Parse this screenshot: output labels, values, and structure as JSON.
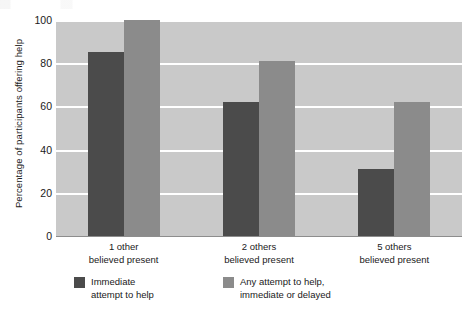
{
  "chart_data": {
    "type": "bar",
    "title": "",
    "xlabel": "",
    "ylabel": "Percentage of participants offering help",
    "ylim": [
      0,
      100
    ],
    "yticks": [
      0,
      20,
      40,
      60,
      80,
      100
    ],
    "grid": true,
    "legend_position": "bottom-left",
    "categories": [
      "1 other believed present",
      "2 others believed present",
      "5 others believed present"
    ],
    "category_lines": [
      {
        "line1": "1 other",
        "line2": "believed present"
      },
      {
        "line1": "2 others",
        "line2": "believed present"
      },
      {
        "line1": "5 others",
        "line2": "believed present"
      }
    ],
    "series": [
      {
        "name": "Immediate attempt to help",
        "name_lines": [
          "Immediate",
          "attempt to help"
        ],
        "color": "#4b4b4b",
        "values": [
          85,
          62,
          31
        ]
      },
      {
        "name": "Any attempt to help, immediate or delayed",
        "name_lines": [
          "Any attempt to help,",
          "immediate or delayed"
        ],
        "color": "#8b8b8b",
        "values": [
          100,
          81,
          62
        ]
      }
    ]
  },
  "colors": {
    "plot_background": "#c9c9c9",
    "gridline": "#ffffff",
    "page_background": "#ffffff",
    "text": "#1a1a1a"
  }
}
